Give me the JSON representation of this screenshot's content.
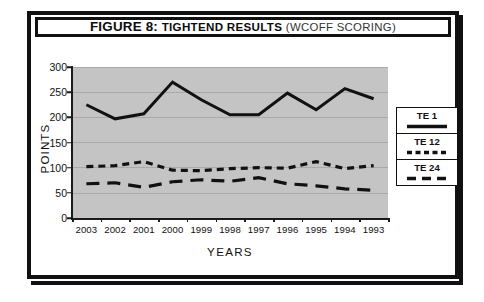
{
  "figure": {
    "title_prefix": "FIGURE 8:",
    "title_main": "TIGHTEND RESULTS",
    "title_suffix": "(WCOFF SCORING)"
  },
  "axes": {
    "y_title": "POINTS",
    "x_title": "YEARS",
    "y_ticks": [
      "0",
      "50",
      "100",
      "150",
      "200",
      "250",
      "300"
    ]
  },
  "legend": {
    "items": [
      {
        "label": "TE 1",
        "style": "solid"
      },
      {
        "label": "TE 12",
        "style": "dotted"
      },
      {
        "label": "TE 24",
        "style": "dashed"
      }
    ]
  },
  "colors": {
    "ink": "#111111",
    "plot_background": "#c4c4c4",
    "gridline": "#a9a9a9",
    "page_background": "#ffffff"
  },
  "chart_data": {
    "type": "line",
    "title": "FIGURE 8: TIGHTEND RESULTS (WCOFF SCORING)",
    "xlabel": "YEARS",
    "ylabel": "POINTS",
    "ylim": [
      0,
      300
    ],
    "yticks": [
      0,
      50,
      100,
      150,
      200,
      250,
      300
    ],
    "grid": true,
    "legend_position": "right",
    "categories": [
      "2003",
      "2002",
      "2001",
      "2000",
      "1999",
      "1998",
      "1997",
      "1996",
      "1995",
      "1994",
      "1993"
    ],
    "series": [
      {
        "name": "TE 1",
        "style": "solid",
        "values": [
          225,
          197,
          207,
          270,
          235,
          205,
          205,
          248,
          215,
          257,
          237
        ]
      },
      {
        "name": "TE 12",
        "style": "dotted",
        "values": [
          102,
          104,
          112,
          95,
          94,
          98,
          100,
          99,
          112,
          98,
          104
        ]
      },
      {
        "name": "TE 24",
        "style": "dashed",
        "values": [
          68,
          70,
          61,
          72,
          76,
          73,
          80,
          68,
          64,
          58,
          55
        ]
      }
    ]
  }
}
